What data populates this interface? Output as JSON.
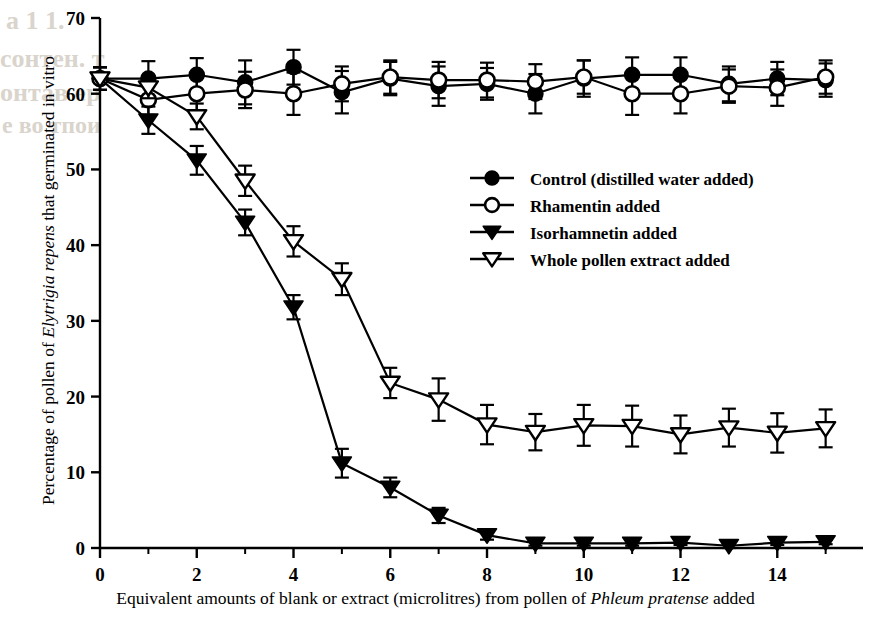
{
  "figure": {
    "xlabel_parts": {
      "pre": "Equivalent amounts of blank or extract (microlitres) from pollen of ",
      "italic": "Phleum pratense",
      "post": " added"
    },
    "ylabel_parts": {
      "pre": "Percentage of pollen of ",
      "italic": "Elytrigia repens",
      "post": " that germinated in vitro"
    },
    "bleed_text": [
      "a 1 1.",
      "сонтен. т",
      "онтав ер",
      "е во тпои"
    ]
  },
  "chart_data": {
    "type": "line",
    "title": "",
    "xlabel": "Equivalent amounts of blank or extract (microlitres) from pollen of Phleum pratense added",
    "ylabel": "Percentage of pollen of Elytrigia repens that germinated in vitro",
    "xlim": [
      0,
      15.4
    ],
    "ylim": [
      0,
      70
    ],
    "xticks": [
      0,
      2,
      4,
      6,
      8,
      10,
      12,
      14
    ],
    "yticks": [
      0,
      10,
      20,
      30,
      40,
      50,
      60,
      70
    ],
    "xtick_labels": [
      "0",
      "2",
      "4",
      "6",
      "8",
      "10",
      "12",
      "14"
    ],
    "ytick_labels": [
      "0",
      "10",
      "20",
      "30",
      "40",
      "50",
      "60",
      "70"
    ],
    "minor_xticks": [
      1,
      3,
      5,
      7,
      9,
      11,
      13,
      15
    ],
    "grid": false,
    "legend_position": "center-right",
    "error_bars": "standard-error",
    "x": [
      0,
      1,
      2,
      3,
      4,
      5,
      6,
      7,
      8,
      9,
      10,
      11,
      12,
      13,
      14,
      15
    ],
    "series": [
      {
        "name": "Control (distilled water added)",
        "marker": "filled-circle",
        "values": [
          62.0,
          62.0,
          62.5,
          61.5,
          63.5,
          60.2,
          62.0,
          61.0,
          61.3,
          60.0,
          62.0,
          62.5,
          62.5,
          61.3,
          62.0,
          61.8
        ],
        "errors": [
          1.5,
          2.3,
          2.2,
          2.9,
          2.3,
          2.8,
          2.2,
          2.6,
          2.1,
          2.6,
          2.4,
          2.3,
          2.3,
          2.3,
          2.2,
          2.2
        ]
      },
      {
        "name": "Rhamentin added",
        "marker": "open-circle",
        "values": [
          62.0,
          59.2,
          60.0,
          60.5,
          60.0,
          61.3,
          62.2,
          61.8,
          61.8,
          61.6,
          62.2,
          60.0,
          60.0,
          61.0,
          60.8,
          62.2
        ],
        "errors": [
          1.5,
          2.0,
          2.2,
          2.4,
          2.8,
          2.3,
          2.2,
          2.4,
          2.3,
          2.3,
          2.2,
          2.8,
          2.6,
          2.2,
          2.4,
          2.2
        ]
      },
      {
        "name": "Isorhamnetin added",
        "marker": "filled-triangle-down",
        "values": [
          62.0,
          56.5,
          51.2,
          43.0,
          31.8,
          11.2,
          8.0,
          4.3,
          1.7,
          0.6,
          0.6,
          0.6,
          0.7,
          0.3,
          0.7,
          0.8
        ],
        "errors": [
          1.5,
          1.8,
          1.9,
          1.7,
          1.6,
          1.9,
          1.3,
          1.0,
          0.6,
          0.3,
          0.3,
          0.3,
          0.3,
          0.3,
          0.3,
          0.3
        ]
      },
      {
        "name": "Whole pollen extract added",
        "marker": "open-triangle-down",
        "values": [
          62.0,
          60.8,
          57.0,
          48.5,
          40.5,
          35.5,
          21.8,
          19.6,
          16.3,
          15.3,
          16.2,
          16.1,
          15.0,
          15.9,
          15.2,
          15.8
        ],
        "errors": [
          1.5,
          1.4,
          1.7,
          2.0,
          2.0,
          2.1,
          2.0,
          2.8,
          2.6,
          2.4,
          2.7,
          2.7,
          2.5,
          2.5,
          2.6,
          2.5
        ]
      }
    ]
  },
  "legend": {
    "items": [
      {
        "label": "Control (distilled water added)",
        "marker": "filled-circle"
      },
      {
        "label": "Rhamentin added",
        "marker": "open-circle"
      },
      {
        "label": "Isorhamnetin added",
        "marker": "filled-triangle-down"
      },
      {
        "label": "Whole pollen extract added",
        "marker": "open-triangle-down"
      }
    ]
  },
  "colors": {
    "ink": "#1a1a1a",
    "axis": "#000000",
    "background": "#ffffff",
    "bleed": "#d9d4cc"
  }
}
